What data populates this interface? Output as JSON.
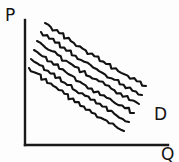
{
  "figure": {
    "kind": "hand-drawn-sketch",
    "background_color": "#fdfdfd",
    "ink_color": "#141414"
  },
  "labels": {
    "y_axis": "P",
    "x_axis": "Q",
    "curve_family": "D"
  },
  "chart_data": {
    "type": "line",
    "title": "",
    "xlabel": "Q",
    "ylabel": "P",
    "grid": false,
    "legend": "none",
    "annotations": [
      {
        "text": "D",
        "x": 0.92,
        "y": 0.28,
        "note": "labels the family of demand curves"
      }
    ],
    "axis_style": "two-axis hand drawn, no tick marks, no numeric scale",
    "xlim": [
      0,
      1
    ],
    "ylim": [
      0,
      1
    ],
    "series_note": "Six parallel downward-sloping hand-drawn demand curves (shifting demand), drawn with a wobbly freehand stroke. No numeric values are printed on the figure.",
    "series": [
      {
        "name": "D1",
        "x": [
          0.09,
          0.28,
          0.47,
          0.66,
          0.85
        ],
        "values": [
          0.74,
          0.63,
          0.52,
          0.41,
          0.3
        ]
      },
      {
        "name": "D2",
        "x": [
          0.07,
          0.26,
          0.45,
          0.64,
          0.83
        ],
        "values": [
          0.67,
          0.56,
          0.45,
          0.34,
          0.24
        ]
      },
      {
        "name": "D3",
        "x": [
          0.05,
          0.24,
          0.43,
          0.62,
          0.81
        ],
        "values": [
          0.6,
          0.49,
          0.38,
          0.28,
          0.18
        ]
      },
      {
        "name": "D4",
        "x": [
          0.04,
          0.23,
          0.42,
          0.61,
          0.79
        ],
        "values": [
          0.53,
          0.43,
          0.32,
          0.22,
          0.12
        ]
      },
      {
        "name": "D5",
        "x": [
          0.03,
          0.22,
          0.41,
          0.59,
          0.77
        ],
        "values": [
          0.46,
          0.36,
          0.26,
          0.16,
          0.07
        ]
      },
      {
        "name": "D6",
        "x": [
          0.02,
          0.21,
          0.39,
          0.57,
          0.75
        ],
        "values": [
          0.39,
          0.29,
          0.19,
          0.1,
          0.02
        ]
      }
    ]
  },
  "geometry": {
    "y_axis": {
      "x": 25,
      "y_top": 20,
      "y_bottom": 145
    },
    "x_axis": {
      "y": 145,
      "x_left": 25,
      "x_right": 168
    },
    "curves": [
      {
        "id": "D1",
        "x1": 45,
        "y1": 23,
        "x2": 146,
        "y2": 86
      },
      {
        "id": "D2",
        "x1": 41,
        "y1": 32,
        "x2": 142,
        "y2": 95
      },
      {
        "id": "D3",
        "x1": 37,
        "y1": 41,
        "x2": 139,
        "y2": 104
      },
      {
        "id": "D4",
        "x1": 34,
        "y1": 50,
        "x2": 134,
        "y2": 113
      },
      {
        "id": "D5",
        "x1": 31,
        "y1": 59,
        "x2": 129,
        "y2": 122
      },
      {
        "id": "D6",
        "x1": 29,
        "y1": 68,
        "x2": 124,
        "y2": 131
      }
    ],
    "wobble_amplitude": 1.35,
    "wobble_segments": 34
  }
}
